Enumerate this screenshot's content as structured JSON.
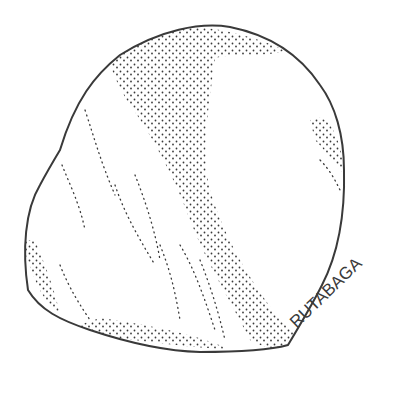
{
  "illustration": {
    "subject": "rutabaga",
    "style": "pen-and-ink stipple drawing",
    "label": "RUTABAGA",
    "ink_color": "#3a3a3a",
    "background_color": "#ffffff"
  }
}
